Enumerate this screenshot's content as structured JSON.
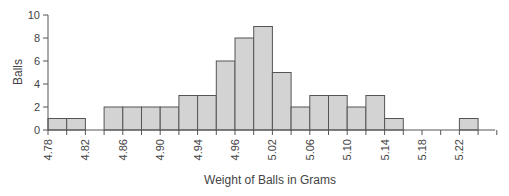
{
  "chart_data": {
    "type": "bar",
    "subtype": "histogram",
    "title": "",
    "xlabel": "Weight of Balls in Grams",
    "ylabel": "Balls",
    "bin_width": 0.02,
    "bin_start": 4.78,
    "categories": [
      "4.78-4.80",
      "4.80-4.82",
      "4.82-4.84",
      "4.84-4.86",
      "4.86-4.88",
      "4.88-4.90",
      "4.90-4.92",
      "4.92-4.94",
      "4.94-4.96",
      "4.96-4.98",
      "4.98-5.00",
      "5.00-5.02",
      "5.02-5.04",
      "5.04-5.06",
      "5.06-5.08",
      "5.08-5.10",
      "5.10-5.12",
      "5.12-5.14",
      "5.14-5.16",
      "5.16-5.18",
      "5.18-5.20",
      "5.20-5.22",
      "5.22-5.24"
    ],
    "values": [
      1,
      1,
      0,
      2,
      2,
      2,
      2,
      3,
      3,
      6,
      8,
      9,
      5,
      2,
      3,
      3,
      2,
      3,
      1,
      0,
      0,
      0,
      1
    ],
    "ylim": [
      0,
      10
    ],
    "yticks": [
      "0",
      "2",
      "4",
      "6",
      "8",
      "10"
    ],
    "xtick_labels": [
      "4.78",
      "4.82",
      "4.86",
      "4.90",
      "4.94",
      "4.96",
      "5.02",
      "5.06",
      "5.10",
      "5.14",
      "5.18",
      "5.22"
    ],
    "grid": false,
    "legend": null,
    "colors": {
      "bar_fill": "#d3d3d3",
      "bar_stroke": "#555555",
      "axis": "#555555"
    }
  }
}
